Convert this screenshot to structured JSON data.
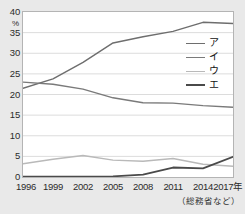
{
  "chart_data": {
    "type": "line",
    "title": "",
    "subtitle": "",
    "xlabel": "",
    "ylabel": "%",
    "y_unit": "%",
    "categories": [
      "1996",
      "1999",
      "2002",
      "2005",
      "2008",
      "2011",
      "2014",
      "2017"
    ],
    "x_tick_labels": [
      "1996",
      "1999",
      "2002",
      "2005",
      "2008",
      "2011",
      "2014",
      "2017年"
    ],
    "xlim": [
      1996,
      2017
    ],
    "ylim": [
      0,
      40
    ],
    "y_ticks": [
      0,
      5,
      10,
      15,
      20,
      25,
      30,
      35,
      40
    ],
    "y_tick_labels": [
      "0",
      "5",
      "10",
      "15",
      "20",
      "25",
      "30",
      "35",
      "40"
    ],
    "grid": true,
    "grid_axis": "y",
    "legend_position": "right",
    "series": [
      {
        "name": "ア",
        "color": "#6e6e6e",
        "width": 1.4,
        "values": [
          21.5,
          23.8,
          27.8,
          32.5,
          34.0,
          35.3,
          37.5,
          37.2
        ]
      },
      {
        "name": "イ",
        "color": "#7a7a7a",
        "width": 1.4,
        "values": [
          23.0,
          22.5,
          21.3,
          19.2,
          18.0,
          17.9,
          17.3,
          16.9
        ]
      },
      {
        "name": "ウ",
        "color": "#b9b9b9",
        "width": 1.4,
        "values": [
          3.2,
          4.3,
          5.2,
          4.1,
          3.8,
          4.5,
          3.1,
          2.6
        ]
      },
      {
        "name": "エ",
        "color": "#4a4a4a",
        "width": 1.8,
        "values": [
          0.1,
          0.1,
          0.1,
          0.15,
          0.6,
          2.3,
          2.1,
          4.9
        ]
      }
    ],
    "annotations": []
  },
  "legend": {
    "entries": [
      {
        "label": "ア"
      },
      {
        "label": "イ"
      },
      {
        "label": "ウ"
      },
      {
        "label": "エ"
      }
    ]
  },
  "source": {
    "text": "（総務省など）"
  },
  "colors": {
    "page_background": "#e9e9e9",
    "plot_background": "#ffffff",
    "plot_border": "#b4b4b4",
    "gridline": "#dcdcdc",
    "text": "#2b2b2b"
  }
}
